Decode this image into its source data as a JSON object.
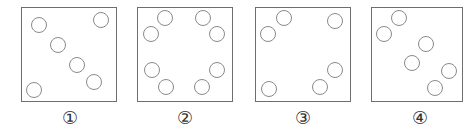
{
  "figure": {
    "panels": [
      {
        "label": "①",
        "box": {
          "left": 21,
          "width": 96
        },
        "label_center_x": 70,
        "circles": [
          [
            39,
            25
          ],
          [
            101,
            20
          ],
          [
            58,
            45
          ],
          [
            77,
            65
          ],
          [
            94,
            82
          ],
          [
            34,
            90
          ]
        ]
      },
      {
        "label": "②",
        "box": {
          "left": 137,
          "width": 96
        },
        "label_center_x": 185,
        "circles": [
          [
            165,
            18
          ],
          [
            203,
            18
          ],
          [
            151,
            34
          ],
          [
            217,
            34
          ],
          [
            152,
            70
          ],
          [
            217,
            70
          ],
          [
            166,
            87
          ],
          [
            202,
            87
          ]
        ]
      },
      {
        "label": "③",
        "box": {
          "left": 255,
          "width": 96
        },
        "label_center_x": 303,
        "circles": [
          [
            284,
            18
          ],
          [
            335,
            21
          ],
          [
            268,
            34
          ],
          [
            335,
            70
          ],
          [
            320,
            87
          ],
          [
            269,
            89
          ]
        ]
      },
      {
        "label": "④",
        "box": {
          "left": 371,
          "width": 92
        },
        "label_center_x": 420,
        "circles": [
          [
            399,
            18
          ],
          [
            384,
            34
          ],
          [
            426,
            44
          ],
          [
            412,
            63
          ],
          [
            449,
            71
          ],
          [
            435,
            88
          ]
        ]
      }
    ],
    "colors": {
      "border": "#6e6e6e",
      "circle": "#8a8a8a",
      "label": "#333333"
    }
  }
}
